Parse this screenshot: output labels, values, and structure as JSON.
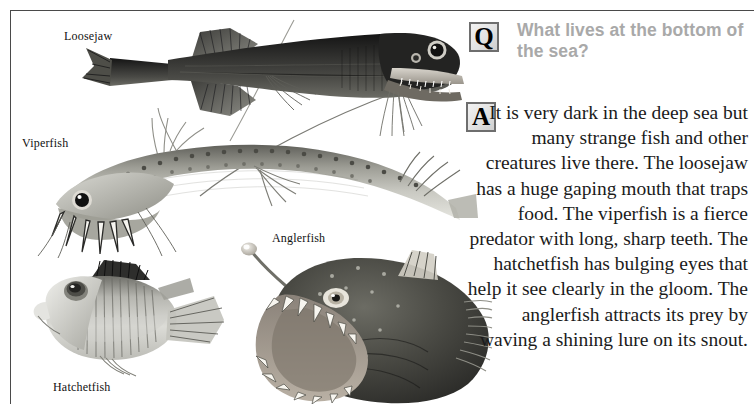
{
  "page": {
    "background_color": "#ffffff",
    "rule_color": "#4a4a4a"
  },
  "qa": {
    "question_badge": "Q",
    "answer_badge": "A",
    "question_text": "What lives at the bottom of the sea?",
    "question_color": "#a9a9a9",
    "answer_text": "It is very dark in the deep sea but many strange fish and other creatures live there. The loosejaw has a huge gaping mouth that traps food. The viperfish is a fierce predator with long, sharp teeth. The hatchetfish has bulging eyes that help it see clearly in the gloom. The anglerfish attracts its prey by waving a shining lure on its snout.",
    "answer_color": "#1b1b1b"
  },
  "figures": [
    {
      "id": "loosejaw",
      "label": "Loosejaw",
      "facing": "right",
      "body_color": "#2b2b2b",
      "description": "long dark deep-sea fish with huge gaping jaw, long chin barbel and forked tail"
    },
    {
      "id": "viperfish",
      "label": "Viperfish",
      "facing": "left",
      "body_color": "#9a9a94",
      "description": "curved silvery fish with very long needle-like fangs and spotted flank"
    },
    {
      "id": "anglerfish",
      "label": "Anglerfish",
      "facing": "left",
      "body_color": "#3a3a3a",
      "description": "bulbous dark fish with illuminated lure on snout and ring of long teeth"
    },
    {
      "id": "hatchetfish",
      "label": "Hatchetfish",
      "facing": "left",
      "body_color": "#b9b9b4",
      "description": "deep-bodied silvery fish with very large bulging upward eye"
    }
  ]
}
